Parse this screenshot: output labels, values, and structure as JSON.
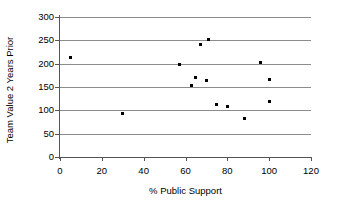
{
  "chart_data": {
    "type": "scatter",
    "title": "",
    "xlabel": "% Public Support",
    "ylabel": "Team Value 2 Years Prior",
    "xlim": [
      0,
      120
    ],
    "ylim": [
      0,
      300
    ],
    "xticks": [
      0,
      20,
      40,
      60,
      80,
      100,
      120
    ],
    "yticks": [
      0,
      50,
      100,
      150,
      200,
      250,
      300
    ],
    "grid": "horizontal",
    "legend": "none",
    "marker": "square",
    "marker_color": "#000000",
    "gridline_color": "#8c8c8c",
    "axis_color": "#555555",
    "points": [
      {
        "x": 5,
        "y": 213
      },
      {
        "x": 30,
        "y": 94
      },
      {
        "x": 57,
        "y": 199
      },
      {
        "x": 63,
        "y": 154
      },
      {
        "x": 65,
        "y": 170
      },
      {
        "x": 67,
        "y": 241
      },
      {
        "x": 70,
        "y": 163
      },
      {
        "x": 71,
        "y": 252
      },
      {
        "x": 75,
        "y": 112
      },
      {
        "x": 80,
        "y": 108
      },
      {
        "x": 88,
        "y": 83
      },
      {
        "x": 96,
        "y": 202
      },
      {
        "x": 100,
        "y": 166
      },
      {
        "x": 100,
        "y": 118
      }
    ]
  },
  "axis": {
    "x_tick_labels": [
      "0",
      "20",
      "40",
      "60",
      "80",
      "100",
      "120"
    ],
    "y_tick_labels": [
      "0",
      "50",
      "100",
      "150",
      "200",
      "250",
      "300"
    ]
  }
}
